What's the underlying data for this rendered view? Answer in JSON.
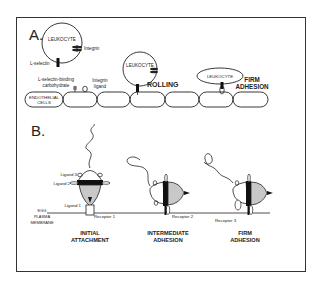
{
  "panel_a": {
    "label": "A.",
    "leukocyte_1": "LEUKOCYTE",
    "integrin": "Integrin",
    "l_selectin": "L-selectin",
    "carb_line1": "L-selectin-binding",
    "carb_line2": "carbohydrate",
    "integrin_ligand_line1": "Integrin",
    "integrin_ligand_line2": "ligand",
    "endothelial_line1": "ENDOTHELIAL",
    "endothelial_line2": "CELLS",
    "leukocyte_2": "LEUKOCYTE",
    "rolling": "ROLLING",
    "leukocyte_3": "LEUKOCYTE",
    "firm_line1": "FIRM",
    "firm_line2": "ADHESION"
  },
  "panel_b": {
    "label": "B.",
    "ligand3": "Ligand 3",
    "ligand2": "Ligand  2",
    "ligand1": "Ligand 1",
    "egg_line1": "EGG",
    "egg_line2": "PLASMA",
    "egg_line3": "MEMBRANE",
    "receptor1": "Receptor 1",
    "receptor2": "Receptor 2",
    "receptor3": "Receptor 3",
    "stage1_line1": "INITIAL",
    "stage1_line2": "ATTACHMENT",
    "stage2_line1": "INTERMEDIATE",
    "stage2_line2": "ADHESION",
    "stage3_line1": "FIRM",
    "stage3_line2": "ADHESION"
  },
  "colors": {
    "stroke": "#222222",
    "fill_gray": "#c8c8c8",
    "band_black": "#111111"
  }
}
